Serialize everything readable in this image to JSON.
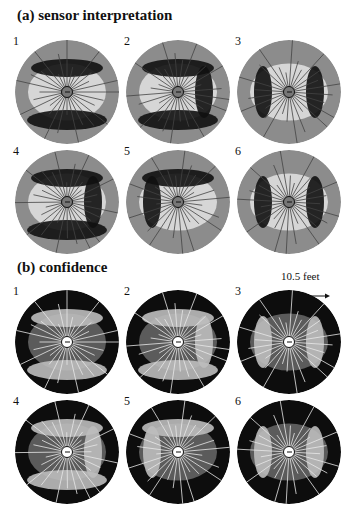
{
  "figure": {
    "panel_a": {
      "title": "(a) sensor interpretation",
      "maps": [
        {
          "label": "1",
          "cx": 67,
          "cy": 92
        },
        {
          "label": "2",
          "cx": 178,
          "cy": 92
        },
        {
          "label": "3",
          "cx": 289,
          "cy": 92
        },
        {
          "label": "4",
          "cx": 67,
          "cy": 202
        },
        {
          "label": "5",
          "cx": 178,
          "cy": 202
        },
        {
          "label": "6",
          "cx": 289,
          "cy": 202
        }
      ]
    },
    "panel_b": {
      "title": "(b) confidence",
      "scale_label": "10.5 feet",
      "maps": [
        {
          "label": "1",
          "cx": 67,
          "cy": 342
        },
        {
          "label": "2",
          "cx": 178,
          "cy": 342
        },
        {
          "label": "3",
          "cx": 289,
          "cy": 342
        },
        {
          "label": "4",
          "cx": 67,
          "cy": 452
        },
        {
          "label": "5",
          "cx": 178,
          "cy": 452
        },
        {
          "label": "6",
          "cx": 289,
          "cy": 452
        }
      ]
    }
  }
}
